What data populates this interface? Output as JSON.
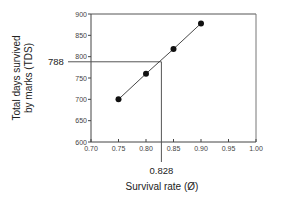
{
  "chart_data": {
    "type": "line",
    "title": "",
    "xlabel": "Survival rate (Ø)",
    "ylabel_line1": "Total days survived",
    "ylabel_line2": "by marks (TDS)",
    "xlim": [
      0.7,
      1.0
    ],
    "ylim": [
      600,
      900
    ],
    "x_ticks": [
      "0.70",
      "0.75",
      "0.80",
      "0.85",
      "0.90",
      "0.95",
      "1.00"
    ],
    "y_ticks": [
      "600",
      "650",
      "700",
      "750",
      "800",
      "850",
      "900"
    ],
    "grid": false,
    "legend": null,
    "series": [
      {
        "name": "TDS vs survival rate",
        "x": [
          0.75,
          0.8,
          0.85,
          0.9
        ],
        "y": [
          700,
          760,
          818,
          878
        ],
        "marker": "filled-circle"
      }
    ],
    "annotations": [
      {
        "type": "reference-line-horizontal",
        "value": 788,
        "label": "788"
      },
      {
        "type": "reference-line-vertical",
        "value": 0.828,
        "label": "0.828"
      }
    ]
  }
}
